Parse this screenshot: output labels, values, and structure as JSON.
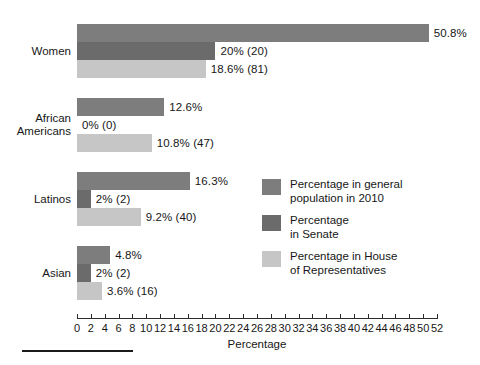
{
  "chart_data": {
    "type": "bar",
    "orientation": "horizontal",
    "title": "",
    "xlabel": "Percentage",
    "ylabel": "",
    "xlim": [
      0,
      52
    ],
    "xticks": [
      0,
      2,
      4,
      6,
      8,
      10,
      12,
      14,
      16,
      18,
      20,
      22,
      24,
      26,
      28,
      30,
      32,
      34,
      36,
      38,
      40,
      42,
      44,
      46,
      48,
      50,
      52
    ],
    "grid": false,
    "legend_position": "right-middle",
    "categories": [
      "Women",
      "African\nAmericans",
      "Latinos",
      "Asian"
    ],
    "series": [
      {
        "name": "Percentage in general\npopulation in 2010",
        "color": "#7d7d7d",
        "values": [
          50.8,
          12.6,
          16.3,
          4.8
        ],
        "labels": [
          "50.8%",
          "12.6%",
          "16.3%",
          "4.8%"
        ]
      },
      {
        "name": "Percentage\nin Senate",
        "color": "#6b6b6b",
        "values": [
          20,
          0,
          2,
          2
        ],
        "labels": [
          "20% (20)",
          "0% (0)",
          "2% (2)",
          "2% (2)"
        ]
      },
      {
        "name": "Percentage in House\nof Representatives",
        "color": "#c6c6c6",
        "values": [
          18.6,
          10.8,
          9.2,
          3.6
        ],
        "labels": [
          "18.6% (81)",
          "10.8% (47)",
          "9.2% (40)",
          "3.6% (16)"
        ]
      }
    ]
  },
  "axis": {
    "x_title": "Percentage"
  },
  "legend": {
    "items": [
      {
        "label": "Percentage in general\npopulation in 2010",
        "color": "#7d7d7d"
      },
      {
        "label": "Percentage\nin Senate",
        "color": "#6b6b6b"
      },
      {
        "label": "Percentage in House\nof Representatives",
        "color": "#c6c6c6"
      }
    ]
  }
}
